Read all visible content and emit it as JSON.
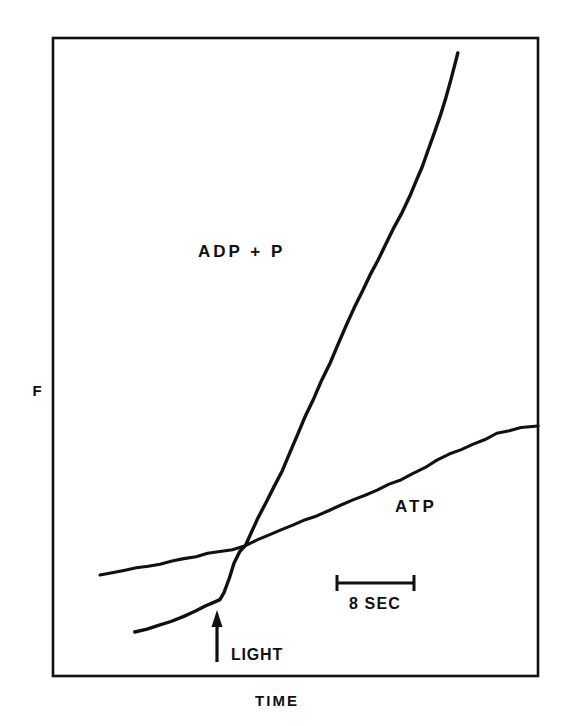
{
  "page": {
    "running_head": "J. PHOTOCHEMISTRY OF BACTERIORHODOPSIN",
    "background_color": "#ffffff",
    "ink_color": "#111111"
  },
  "figure": {
    "frame": {
      "x": 53,
      "y": 38,
      "width": 485,
      "height": 638
    },
    "axis_labels": {
      "y_label": "F",
      "x_label": "TIME"
    },
    "series_labels": [
      {
        "name": "adp-p",
        "text": "ADP + P",
        "x": 198,
        "y": 257
      },
      {
        "name": "atp",
        "text": "ATP",
        "x": 395,
        "y": 512
      }
    ],
    "annotations": {
      "light_marker": {
        "label": "LIGHT",
        "arrow_x": 217,
        "arrow_base_y": 662,
        "arrow_tip_y": 612,
        "label_x": 231,
        "label_y": 660
      },
      "scale_bar": {
        "label": "8 SEC",
        "x_start": 336,
        "x_end": 415,
        "y": 583,
        "cap_half_height": 8,
        "label_x": 375,
        "label_y": 608
      }
    }
  },
  "chart_data": {
    "type": "line",
    "title": "",
    "xlabel": "TIME",
    "ylabel": "F",
    "grid": false,
    "legend": "inline-labels",
    "axis_ranges": {
      "x": "arbitrary time",
      "y": "arbitrary fluorescence"
    },
    "scale_reference": {
      "length_label": "8 SEC",
      "pixel_length": 79
    },
    "event_marker": {
      "label": "LIGHT",
      "x_pixel": 217
    },
    "series": [
      {
        "name": "ATP",
        "description": "Slowly rising baseline trace, roughly linear, unaffected in slope by light onset",
        "points": [
          [
            100,
            575
          ],
          [
            112,
            573
          ],
          [
            124,
            570
          ],
          [
            136,
            568
          ],
          [
            148,
            566
          ],
          [
            160,
            564
          ],
          [
            172,
            561
          ],
          [
            184,
            559
          ],
          [
            196,
            557
          ],
          [
            208,
            554
          ],
          [
            220,
            552
          ],
          [
            232,
            549
          ],
          [
            245,
            545
          ],
          [
            257,
            540
          ],
          [
            269,
            535
          ],
          [
            281,
            530
          ],
          [
            293,
            525
          ],
          [
            305,
            520
          ],
          [
            317,
            515
          ],
          [
            329,
            510
          ],
          [
            341,
            505
          ],
          [
            353,
            500
          ],
          [
            365,
            495
          ],
          [
            377,
            490
          ],
          [
            389,
            485
          ],
          [
            401,
            479
          ],
          [
            413,
            473
          ],
          [
            425,
            467
          ],
          [
            437,
            461
          ],
          [
            449,
            455
          ],
          [
            461,
            449
          ],
          [
            473,
            444
          ],
          [
            485,
            439
          ],
          [
            497,
            434
          ],
          [
            509,
            431
          ],
          [
            521,
            428
          ],
          [
            538,
            426
          ]
        ]
      },
      {
        "name": "ADP + P",
        "description": "Lower baseline before light, sharp upward break at LIGHT marker, then steep near-linear rise",
        "points": [
          [
            135,
            632
          ],
          [
            147,
            629
          ],
          [
            159,
            626
          ],
          [
            171,
            622
          ],
          [
            183,
            617
          ],
          [
            195,
            611
          ],
          [
            205,
            606
          ],
          [
            214,
            602
          ],
          [
            220,
            600
          ],
          [
            224,
            592
          ],
          [
            229,
            578
          ],
          [
            234,
            563
          ],
          [
            240,
            551
          ],
          [
            245,
            545
          ],
          [
            251,
            533
          ],
          [
            258,
            519
          ],
          [
            266,
            503
          ],
          [
            274,
            487
          ],
          [
            282,
            470
          ],
          [
            290,
            452
          ],
          [
            298,
            434
          ],
          [
            306,
            416
          ],
          [
            314,
            398
          ],
          [
            322,
            380
          ],
          [
            330,
            362
          ],
          [
            338,
            344
          ],
          [
            346,
            326
          ],
          [
            354,
            308
          ],
          [
            362,
            292
          ],
          [
            370,
            276
          ],
          [
            378,
            260
          ],
          [
            386,
            244
          ],
          [
            394,
            228
          ],
          [
            402,
            212
          ],
          [
            410,
            196
          ],
          [
            416,
            182
          ],
          [
            422,
            166
          ],
          [
            428,
            150
          ],
          [
            434,
            134
          ],
          [
            440,
            116
          ],
          [
            446,
            98
          ],
          [
            451,
            80
          ],
          [
            455,
            64
          ],
          [
            458,
            53
          ]
        ]
      }
    ]
  }
}
